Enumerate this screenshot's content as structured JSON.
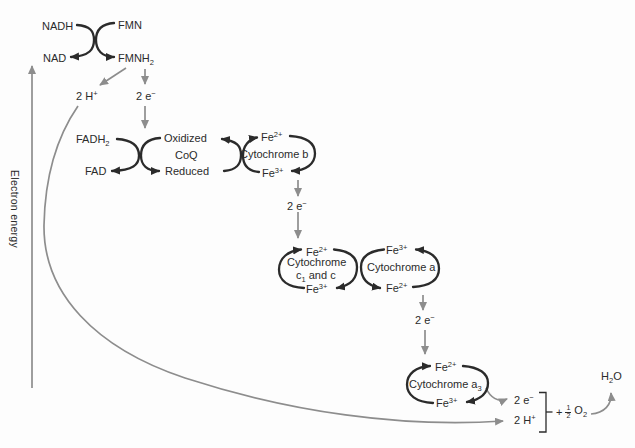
{
  "colors": {
    "stroke_black": "#2b2b2b",
    "stroke_gray": "#8d8d8d",
    "text": "#2b2b2b",
    "background": "#fdfdfd"
  },
  "axis": {
    "label": "Electron energy"
  },
  "step1": {
    "nadh": "NADH",
    "fmn": "FMN",
    "nad": "NAD",
    "fmnh2": {
      "base": "FMNH",
      "sub": "2"
    },
    "protons": {
      "base": "2 H",
      "sup": "+"
    },
    "electrons": {
      "base": "2 e",
      "sup": "−"
    }
  },
  "step2": {
    "fadh2": {
      "base": "FADH",
      "sub": "2"
    },
    "fad": "FAD",
    "coq": {
      "top": "Oxidized",
      "name": "CoQ",
      "bottom": "Reduced"
    },
    "cyt_b": {
      "fe_top_base": "Fe",
      "fe_top_sup": "2+",
      "name": "Cytochrome b",
      "fe_bot_base": "Fe",
      "fe_bot_sup": "3+"
    },
    "electrons": {
      "base": "2 e",
      "sup": "−"
    }
  },
  "step3": {
    "cyt_c": {
      "fe_top_base": "Fe",
      "fe_top_sup": "2+",
      "name1": "Cytochrome",
      "name2_pre": "c",
      "name2_sub": "1",
      "name2_post": " and c",
      "fe_bot_base": "Fe",
      "fe_bot_sup": "3+"
    },
    "cyt_a": {
      "fe_top_base": "Fe",
      "fe_top_sup": "3+",
      "name": "Cytochrome a",
      "fe_bot_base": "Fe",
      "fe_bot_sup": "2+"
    },
    "electrons": {
      "base": "2 e",
      "sup": "−"
    }
  },
  "step4": {
    "cyt_a3": {
      "fe_top_base": "Fe",
      "fe_top_sup": "2+",
      "name_base": "Cytochrome a",
      "name_sub": "3",
      "fe_bot_base": "Fe",
      "fe_bot_sup": "3+"
    },
    "electrons": {
      "base": "2 e",
      "sup": "−"
    },
    "protons": {
      "base": "2 H",
      "sup": "+"
    },
    "oxygen": {
      "plus": "+",
      "num": "1",
      "den": "2",
      "base": "O",
      "sub": "2"
    },
    "water": {
      "base": "H",
      "sub": "2",
      "post": "O"
    }
  }
}
